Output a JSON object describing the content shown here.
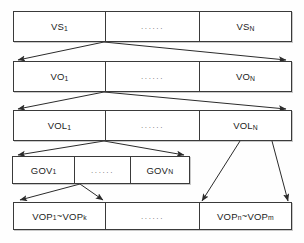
{
  "diagram": {
    "type": "hierarchy-block-diagram",
    "stroke_color": "#3a3a3a",
    "background_color": "#fefefe",
    "levels": [
      {
        "name": "video-session-level",
        "cells": [
          {
            "label_main": "VS",
            "label_sub": "1",
            "kind": "item"
          },
          {
            "label_main": "......",
            "label_sub": "",
            "kind": "ellipsis"
          },
          {
            "label_main": "VS",
            "label_sub": "N",
            "kind": "item"
          }
        ]
      },
      {
        "name": "video-object-level",
        "cells": [
          {
            "label_main": "VO",
            "label_sub": "1",
            "kind": "item"
          },
          {
            "label_main": "......",
            "label_sub": "",
            "kind": "ellipsis"
          },
          {
            "label_main": "VO",
            "label_sub": "N",
            "kind": "item"
          }
        ]
      },
      {
        "name": "video-object-layer-level",
        "cells": [
          {
            "label_main": "VOL",
            "label_sub": "1",
            "kind": "item"
          },
          {
            "label_main": "......",
            "label_sub": "",
            "kind": "ellipsis"
          },
          {
            "label_main": "VOL",
            "label_sub": "N",
            "kind": "item"
          }
        ]
      },
      {
        "name": "group-of-vop-level",
        "cells": [
          {
            "label_main": "GOV",
            "label_sub": "1",
            "kind": "item"
          },
          {
            "label_main": "......",
            "label_sub": "",
            "kind": "ellipsis"
          },
          {
            "label_main": "GOV",
            "label_sub": "N",
            "kind": "item"
          }
        ]
      },
      {
        "name": "vop-level",
        "cells": [
          {
            "label_main": "VOP",
            "label_sub": "1",
            "range_to_main": "VOP",
            "range_to_sub": "k",
            "kind": "range"
          },
          {
            "label_main": "......",
            "label_sub": "",
            "kind": "ellipsis"
          },
          {
            "label_main": "VOP",
            "label_sub": "n",
            "range_to_main": "VOP",
            "range_to_sub": "m",
            "kind": "range"
          }
        ]
      }
    ],
    "connector_count": 10
  }
}
